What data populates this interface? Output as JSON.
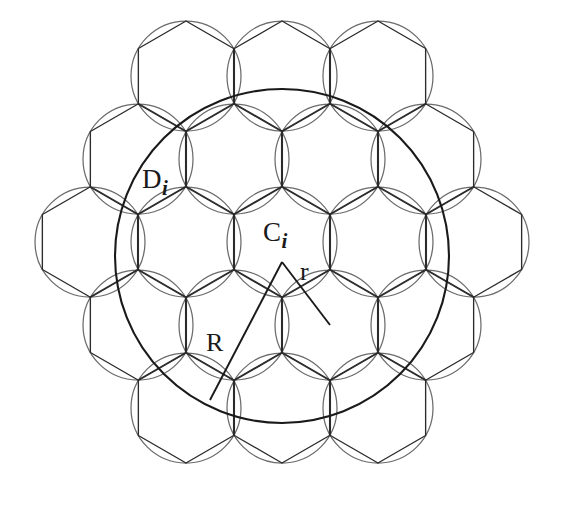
{
  "figure": {
    "background_color": "#ffffff",
    "width": 562,
    "height": 513,
    "line_color": "#2b2b2b",
    "thin_line_color": "#6b6b6b",
    "emphasis_line_color": "#1a1a1a"
  },
  "labels": {
    "coverage_disc": {
      "base": "D",
      "sub": "i"
    },
    "cell_center": {
      "base": "C",
      "sub": "i"
    },
    "outer_radius": "R",
    "inner_radius": "r"
  },
  "geometry": {
    "hex_circumradius": 55,
    "hex_orientation": "pointy-top",
    "cell_centers": [
      {
        "cx": 186,
        "cy": 76
      },
      {
        "cx": 282,
        "cy": 76
      },
      {
        "cx": 378,
        "cy": 76
      },
      {
        "cx": 138,
        "cy": 159
      },
      {
        "cx": 234,
        "cy": 159
      },
      {
        "cx": 330,
        "cy": 159
      },
      {
        "cx": 426,
        "cy": 159
      },
      {
        "cx": 90,
        "cy": 242
      },
      {
        "cx": 186,
        "cy": 242
      },
      {
        "cx": 282,
        "cy": 242
      },
      {
        "cx": 378,
        "cy": 242
      },
      {
        "cx": 474,
        "cy": 242
      },
      {
        "cx": 138,
        "cy": 325
      },
      {
        "cx": 234,
        "cy": 325
      },
      {
        "cx": 330,
        "cy": 325
      },
      {
        "cx": 426,
        "cy": 325
      },
      {
        "cx": 186,
        "cy": 408
      },
      {
        "cx": 282,
        "cy": 408
      },
      {
        "cx": 378,
        "cy": 408
      }
    ],
    "big_circle": {
      "cx": 282,
      "cy": 256,
      "r": 167
    },
    "triangle": {
      "apex": {
        "x": 282,
        "y": 262
      },
      "left_vertex": {
        "x": 210,
        "y": 400
      },
      "right_vertex": {
        "x": 330,
        "y": 325
      }
    }
  }
}
